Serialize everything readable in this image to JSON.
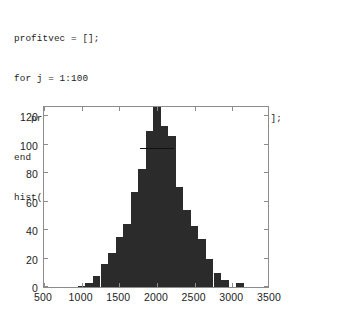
{
  "code": {
    "language": "matlab",
    "lines": [
      "profitvec = [];",
      "for j = 1:100",
      "   profitvec = [profitvec profits(100000, 10)];",
      "end",
      "hist(profitvec, 500:100:3500); axis tight"
    ]
  },
  "chart_data": {
    "type": "bar",
    "title": "",
    "subtitle": "",
    "xlabel": "",
    "ylabel": "",
    "xlim": [
      500,
      3500
    ],
    "ylim": [
      0,
      128
    ],
    "grid": false,
    "legend": null,
    "bin_width": 100,
    "bar_color": "#2b2b2b",
    "axis_color": "#8c8c8c",
    "xticks": [
      500,
      1000,
      1500,
      2000,
      2500,
      3000,
      3500
    ],
    "xtick_labels": [
      "500",
      "1000",
      "1500",
      "2000",
      "2500",
      "3000",
      "3500"
    ],
    "yticks": [
      0,
      20,
      40,
      60,
      80,
      100,
      120
    ],
    "ytick_labels": [
      "0",
      "20",
      "40",
      "60",
      "80",
      "100",
      "120"
    ],
    "categories": [
      500,
      600,
      700,
      800,
      900,
      1000,
      1100,
      1200,
      1300,
      1400,
      1500,
      1600,
      1700,
      1800,
      1900,
      2000,
      2100,
      2200,
      2300,
      2400,
      2500,
      2600,
      2700,
      2800,
      2900,
      3000,
      3100,
      3200,
      3300,
      3400,
      3500
    ],
    "values": [
      0,
      0,
      0,
      0,
      0,
      1,
      3,
      8,
      16,
      24,
      35,
      44,
      67,
      83,
      110,
      128,
      113,
      106,
      70,
      54,
      43,
      34,
      20,
      10,
      5,
      0,
      3,
      0,
      0,
      0,
      0
    ]
  }
}
